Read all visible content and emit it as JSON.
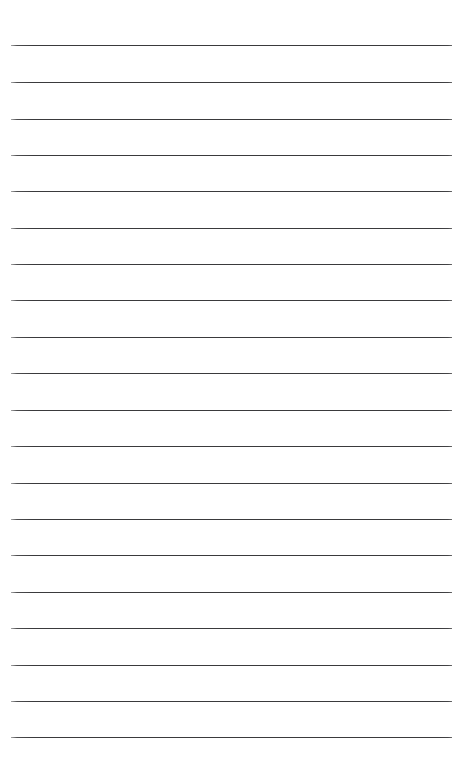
{
  "page": {
    "kind": "ruled-notebook-paper",
    "width": 465,
    "height": 766,
    "background_color": "#ffffff",
    "orientation": "portrait",
    "content_text": "",
    "has_visible_text": false,
    "has_margin_rule": false,
    "has_holes": false,
    "label": "Blank lined paper"
  },
  "ruling": {
    "line_color": "#3a3a3c",
    "line_thickness_px": 1.4,
    "line_count": 20,
    "line_left_px": 11,
    "line_right_px": 452,
    "line_width_px": 441,
    "first_line_y_px": 45,
    "last_line_y_px": 737,
    "line_spacing_px": 36.4,
    "top_margin_px": 45,
    "bottom_margin_px": 29,
    "left_margin_px": 11,
    "right_margin_px": 13,
    "lines_y": [
      45,
      82,
      119,
      155,
      191,
      228,
      264,
      300,
      337,
      373,
      410,
      446,
      483,
      519,
      555,
      592,
      628,
      665,
      701,
      737
    ]
  },
  "writing_lines": [
    {
      "index": 1,
      "y": 45,
      "text": ""
    },
    {
      "index": 2,
      "y": 82,
      "text": ""
    },
    {
      "index": 3,
      "y": 119,
      "text": ""
    },
    {
      "index": 4,
      "y": 155,
      "text": ""
    },
    {
      "index": 5,
      "y": 191,
      "text": ""
    },
    {
      "index": 6,
      "y": 228,
      "text": ""
    },
    {
      "index": 7,
      "y": 264,
      "text": ""
    },
    {
      "index": 8,
      "y": 300,
      "text": ""
    },
    {
      "index": 9,
      "y": 337,
      "text": ""
    },
    {
      "index": 10,
      "y": 373,
      "text": ""
    },
    {
      "index": 11,
      "y": 410,
      "text": ""
    },
    {
      "index": 12,
      "y": 446,
      "text": ""
    },
    {
      "index": 13,
      "y": 483,
      "text": ""
    },
    {
      "index": 14,
      "y": 519,
      "text": ""
    },
    {
      "index": 15,
      "y": 555,
      "text": ""
    },
    {
      "index": 16,
      "y": 592,
      "text": ""
    },
    {
      "index": 17,
      "y": 628,
      "text": ""
    },
    {
      "index": 18,
      "y": 665,
      "text": ""
    },
    {
      "index": 19,
      "y": 701,
      "text": ""
    },
    {
      "index": 20,
      "y": 737,
      "text": ""
    }
  ]
}
